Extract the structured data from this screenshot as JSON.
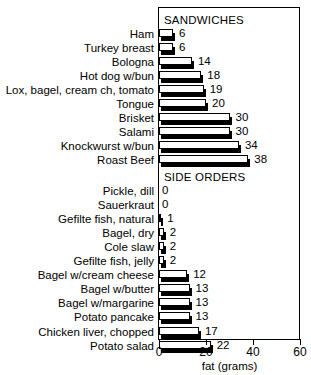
{
  "chart_data": {
    "type": "bar",
    "orientation": "horizontal",
    "title": "",
    "xlabel": "fat (grams)",
    "ylabel": "",
    "xlim": [
      0,
      60
    ],
    "xticks": [
      0,
      20,
      40,
      60
    ],
    "xtick_labels": [
      "0",
      "20",
      "40",
      "60"
    ],
    "grid": false,
    "legend": false,
    "sections": [
      {
        "caption": "SANDWICHES",
        "categories": [
          "Ham",
          "Turkey breast",
          "Bologna",
          "Hot dog w/bun",
          "Lox, bagel, cream ch, tomato",
          "Tongue",
          "Brisket",
          "Salami",
          "Knockwurst w/bun",
          "Roast Beef"
        ],
        "values": [
          6,
          6,
          14,
          18,
          19,
          20,
          30,
          30,
          34,
          38
        ],
        "value_labels": [
          "6",
          "6",
          "14",
          "18",
          "19",
          "20",
          "30",
          "30",
          "34",
          "38"
        ]
      },
      {
        "caption": "SIDE ORDERS",
        "categories": [
          "Pickle, dill",
          "Sauerkraut",
          "Gefilte fish, natural",
          "Bagel, dry",
          "Cole slaw",
          "Gefilte fish, jelly",
          "Bagel w/cream cheese",
          "Bagel w/butter",
          "Bagel w/margarine",
          "Potato pancake",
          "Chicken liver, chopped",
          "Potato salad"
        ],
        "values": [
          0,
          0,
          1,
          2,
          2,
          2,
          12,
          13,
          13,
          13,
          17,
          22
        ],
        "value_labels": [
          "0",
          "0",
          "1",
          "2",
          "2",
          "2",
          "12",
          "13",
          "13",
          "13",
          "17",
          "22"
        ]
      }
    ],
    "colors": {
      "bar_face": "#ffffff",
      "bar_edge": "#000000",
      "bar_shadow": "#000000",
      "axis": "#000000",
      "background": "#ffffff"
    }
  }
}
